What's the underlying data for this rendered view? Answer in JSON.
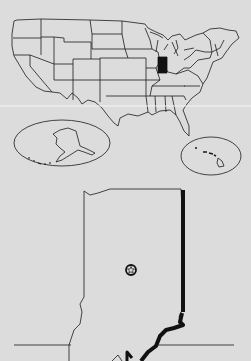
{
  "map": {
    "type": "locator-map",
    "highlighted_state": "Indiana",
    "insets": [
      "Alaska",
      "Hawaii"
    ],
    "detail_state": "Indiana",
    "marker": "capital-star",
    "colors": {
      "background": "#dcdcdc",
      "line": "#1a1a1a",
      "highlight": "#111111"
    }
  }
}
